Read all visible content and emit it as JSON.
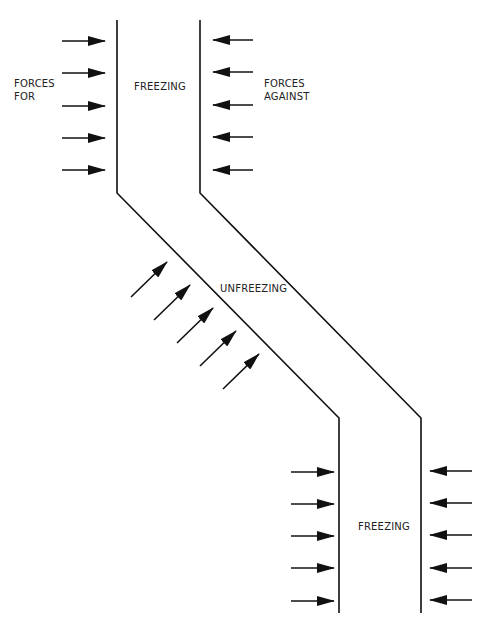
{
  "title_fragment": "",
  "diagram": {
    "type": "force-field-change-model",
    "labels": {
      "forces_for": [
        "FORCES",
        "FOR"
      ],
      "forces_against": [
        "FORCES",
        "AGAINST"
      ],
      "freezing_top": "FREEZING",
      "unfreezing": "UNFREEZING",
      "freezing_bottom": "FREEZING"
    },
    "channel": {
      "left_line": [
        [
          117,
          20
        ],
        [
          117,
          193
        ],
        [
          339,
          418
        ],
        [
          339,
          613
        ]
      ],
      "right_line": [
        [
          200,
          20
        ],
        [
          200,
          193
        ],
        [
          421,
          418
        ],
        [
          421,
          613
        ]
      ]
    },
    "arrows": {
      "top_for": [
        [
          62,
          41,
          105,
          41
        ],
        [
          62,
          73,
          105,
          73
        ],
        [
          62,
          106,
          105,
          106
        ],
        [
          62,
          138,
          105,
          138
        ],
        [
          62,
          170,
          105,
          170
        ]
      ],
      "top_against": [
        [
          253,
          40,
          213,
          40
        ],
        [
          253,
          72,
          213,
          72
        ],
        [
          253,
          105,
          213,
          105
        ],
        [
          253,
          137,
          213,
          137
        ],
        [
          253,
          170,
          213,
          170
        ]
      ],
      "diagonal_for": [
        [
          131,
          297,
          167,
          262
        ],
        [
          154,
          320,
          190,
          285
        ],
        [
          177,
          343,
          213,
          308
        ],
        [
          200,
          366,
          236,
          331
        ],
        [
          223,
          389,
          259,
          354
        ]
      ],
      "bottom_for": [
        [
          291,
          472,
          334,
          472
        ],
        [
          291,
          504,
          334,
          504
        ],
        [
          291,
          536,
          334,
          536
        ],
        [
          291,
          568,
          334,
          568
        ],
        [
          291,
          601,
          334,
          601
        ]
      ],
      "bottom_against": [
        [
          472,
          471,
          430,
          471
        ],
        [
          472,
          503,
          430,
          503
        ],
        [
          472,
          535,
          430,
          535
        ],
        [
          472,
          568,
          430,
          568
        ],
        [
          472,
          600,
          430,
          600
        ]
      ]
    },
    "colors": {
      "line": "#111111",
      "text": "#222222",
      "background": "#ffffff"
    }
  }
}
